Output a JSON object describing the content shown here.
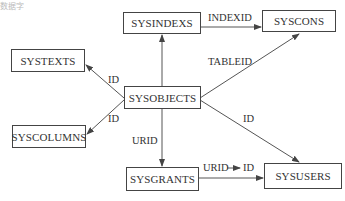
{
  "diagram": {
    "type": "entity-relationship",
    "corner_text": "数据字",
    "nodes": [
      {
        "id": "sysindexs",
        "label": "SYSINDEXS"
      },
      {
        "id": "syscons",
        "label": "SYSCONS"
      },
      {
        "id": "systexts",
        "label": "SYSTEXTS"
      },
      {
        "id": "sysobjects",
        "label": "SYSOBJECTS"
      },
      {
        "id": "syscolumns",
        "label": "SYSCOLUMNS"
      },
      {
        "id": "sysgrants",
        "label": "SYSGRANTS"
      },
      {
        "id": "sysusers",
        "label": "SYSUSERS"
      }
    ],
    "edges": [
      {
        "from": "sysindexs",
        "to": "syscons",
        "label": "INDEXID"
      },
      {
        "from": "sysobjects",
        "to": "syscons",
        "label": "TABLEID"
      },
      {
        "from": "sysobjects",
        "to": "sysindexs",
        "label": ""
      },
      {
        "from": "sysobjects",
        "to": "systexts",
        "label": "ID"
      },
      {
        "from": "sysobjects",
        "to": "syscolumns",
        "label": "ID"
      },
      {
        "from": "sysobjects",
        "to": "sysusers",
        "label": "ID"
      },
      {
        "from": "sysobjects",
        "to": "sysgrants",
        "label": "URID"
      },
      {
        "from": "sysgrants",
        "to": "sysusers",
        "label": "URID → ID"
      }
    ]
  }
}
